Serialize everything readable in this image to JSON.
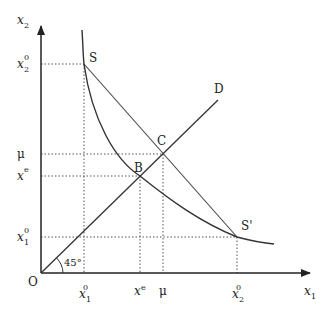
{
  "diagram": {
    "axes": {
      "y_label": "x",
      "y_label_sub": "2",
      "x_label": "x",
      "x_label_sub": "1",
      "origin_label": "O"
    },
    "y_ticks": [
      {
        "base": "x",
        "sup": "0",
        "sub": "2"
      },
      {
        "base": "μ",
        "sup": "",
        "sub": ""
      },
      {
        "base": "x",
        "sup": "e",
        "sub": ""
      },
      {
        "base": "x",
        "sup": "0",
        "sub": "1"
      }
    ],
    "x_ticks": [
      {
        "base": "x",
        "sup": "0",
        "sub": "1"
      },
      {
        "base": "x",
        "sup": "e",
        "sub": ""
      },
      {
        "base": "μ",
        "sup": "",
        "sub": ""
      },
      {
        "base": "x",
        "sup": "0",
        "sub": "2"
      }
    ],
    "points": {
      "S": "S",
      "S_prime": "S'",
      "B": "B",
      "C": "C",
      "D": "D"
    },
    "angle_label": "45°",
    "colors": {
      "line": "#333333",
      "dotted": "#555555",
      "background": "#ffffff"
    }
  }
}
